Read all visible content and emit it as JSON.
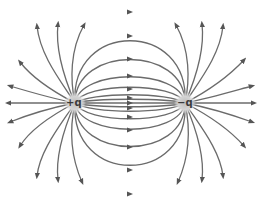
{
  "diagram": {
    "line_color": "#6b6b6b",
    "charge_glow_color": "#bdbdbd",
    "label_color": "#3a3a3a",
    "charges": [
      {
        "label": "+q",
        "sign": "positive",
        "x": 75,
        "y": 103
      },
      {
        "label": "−q",
        "sign": "negative",
        "x": 185,
        "y": 103
      }
    ],
    "closed_arcs_top_peaks_y": [
      12,
      36,
      58,
      75,
      88,
      96
    ],
    "closed_arcs_bottom_peaks_y": [
      197,
      172,
      150,
      132,
      119,
      110
    ],
    "open_lines_per_charge": 10,
    "arrow_direction": "from +q toward -q"
  }
}
